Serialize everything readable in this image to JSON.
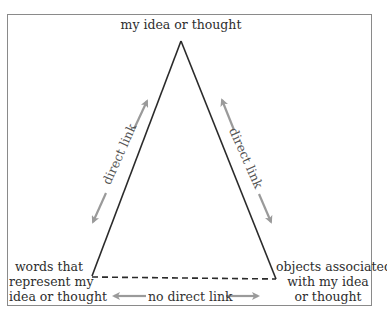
{
  "diagram": {
    "type": "semiotic-triangle",
    "vertices": {
      "apex": {
        "label": "my idea or thought"
      },
      "bottom_left": {
        "label_lines": [
          "words that",
          "represent my",
          "idea or thought"
        ]
      },
      "bottom_right": {
        "label_lines": [
          "objects associated",
          "with my idea",
          "or thought"
        ]
      }
    },
    "edges": {
      "left": {
        "label": "direct link",
        "style": "solid"
      },
      "right": {
        "label": "direct link",
        "style": "solid"
      },
      "base": {
        "label": "no direct link",
        "style": "dashed"
      }
    },
    "colors": {
      "triangle_line": "#2a2a2a",
      "arrow": "#9a9a9a",
      "frame": "#8a8a8a",
      "text": "#2e2e2e"
    }
  }
}
